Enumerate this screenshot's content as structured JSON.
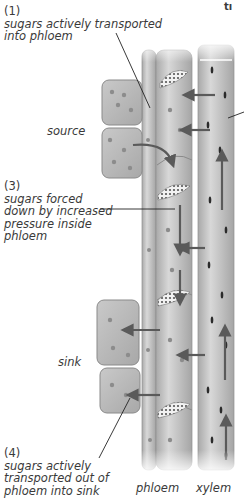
{
  "diagram": {
    "title_fragment": "tı",
    "labels": {
      "step1_num": "(1)",
      "step1_text_line1": "sugars actively transported",
      "step1_text_line2": "into phloem",
      "source": "source",
      "step3_num": "(3)",
      "step3_line1": "sugars forced",
      "step3_line2": "down by increased",
      "step3_line3": "pressure inside",
      "step3_line4": "phloem",
      "sink": "sink",
      "step4_num": "(4)",
      "step4_line1": "sugars actively",
      "step4_line2": "transported out of",
      "step4_line3": "phloem into sink",
      "phloem": "phloem",
      "xylem": "xylem"
    },
    "colors": {
      "cell_fill": "#bdbdbd",
      "cell_stroke": "#8a8a8a",
      "vessel_fill": "#cfcfcf",
      "arrow": "#5a5a5a",
      "leader_line": "#222222",
      "granule": "#8c8c8c"
    }
  }
}
